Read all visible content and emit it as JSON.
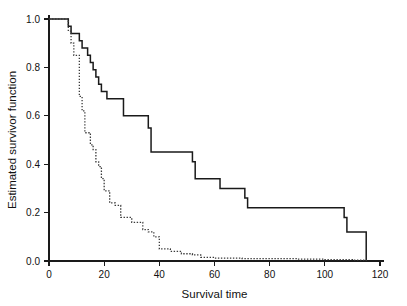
{
  "chart_data": {
    "type": "line",
    "title": "",
    "xlabel": "Survival time",
    "ylabel": "Estimated survivor function",
    "xlim": [
      0,
      120
    ],
    "ylim": [
      0.0,
      1.0
    ],
    "grid": false,
    "legend": "none",
    "xticks": [
      0,
      20,
      40,
      60,
      80,
      100,
      120
    ],
    "xtick_labels": [
      "0",
      "20",
      "40",
      "60",
      "80",
      "100",
      "120"
    ],
    "yticks": [
      0.0,
      0.2,
      0.4,
      0.6,
      0.8,
      1.0
    ],
    "ytick_labels": [
      "0.0",
      "0.2",
      "0.4",
      "0.6",
      "0.8",
      "1.0"
    ],
    "series": [
      {
        "name": "solid-survivor-curve",
        "style": "solid",
        "color": "#1a1a1a",
        "step": "post",
        "x": [
          0,
          5,
          7,
          8,
          9,
          11,
          12,
          14,
          15,
          16,
          17,
          18,
          19,
          21,
          26,
          27,
          35,
          36,
          37,
          38,
          48,
          52,
          53,
          56,
          62,
          68,
          71,
          72,
          84,
          107,
          108,
          115
        ],
        "y": [
          1.0,
          1.0,
          0.97,
          0.94,
          0.94,
          0.91,
          0.88,
          0.85,
          0.82,
          0.79,
          0.76,
          0.73,
          0.7,
          0.67,
          0.67,
          0.6,
          0.6,
          0.55,
          0.45,
          0.45,
          0.45,
          0.41,
          0.34,
          0.34,
          0.3,
          0.3,
          0.26,
          0.22,
          0.22,
          0.18,
          0.12,
          0.0
        ]
      },
      {
        "name": "dotted-survivor-curve",
        "style": "dotted",
        "color": "#3a3a3a",
        "step": "post",
        "x": [
          0,
          6,
          7,
          8,
          9,
          10,
          11,
          12,
          13,
          14,
          15,
          16,
          17,
          18,
          19,
          20,
          22,
          24,
          25,
          26,
          30,
          34,
          36,
          37,
          38,
          40,
          44,
          48,
          52,
          55,
          60,
          70,
          80,
          90,
          100,
          110,
          115
        ],
        "y": [
          1.0,
          1.0,
          0.95,
          0.9,
          0.85,
          0.85,
          0.68,
          0.62,
          0.53,
          0.53,
          0.48,
          0.46,
          0.41,
          0.39,
          0.34,
          0.29,
          0.24,
          0.23,
          0.23,
          0.18,
          0.16,
          0.13,
          0.12,
          0.12,
          0.1,
          0.05,
          0.04,
          0.03,
          0.025,
          0.015,
          0.012,
          0.01,
          0.01,
          0.008,
          0.006,
          0.004,
          0.0
        ]
      }
    ]
  },
  "geometry": {
    "plot_left": 49,
    "plot_right": 380,
    "plot_top": 19,
    "plot_bottom": 261
  }
}
